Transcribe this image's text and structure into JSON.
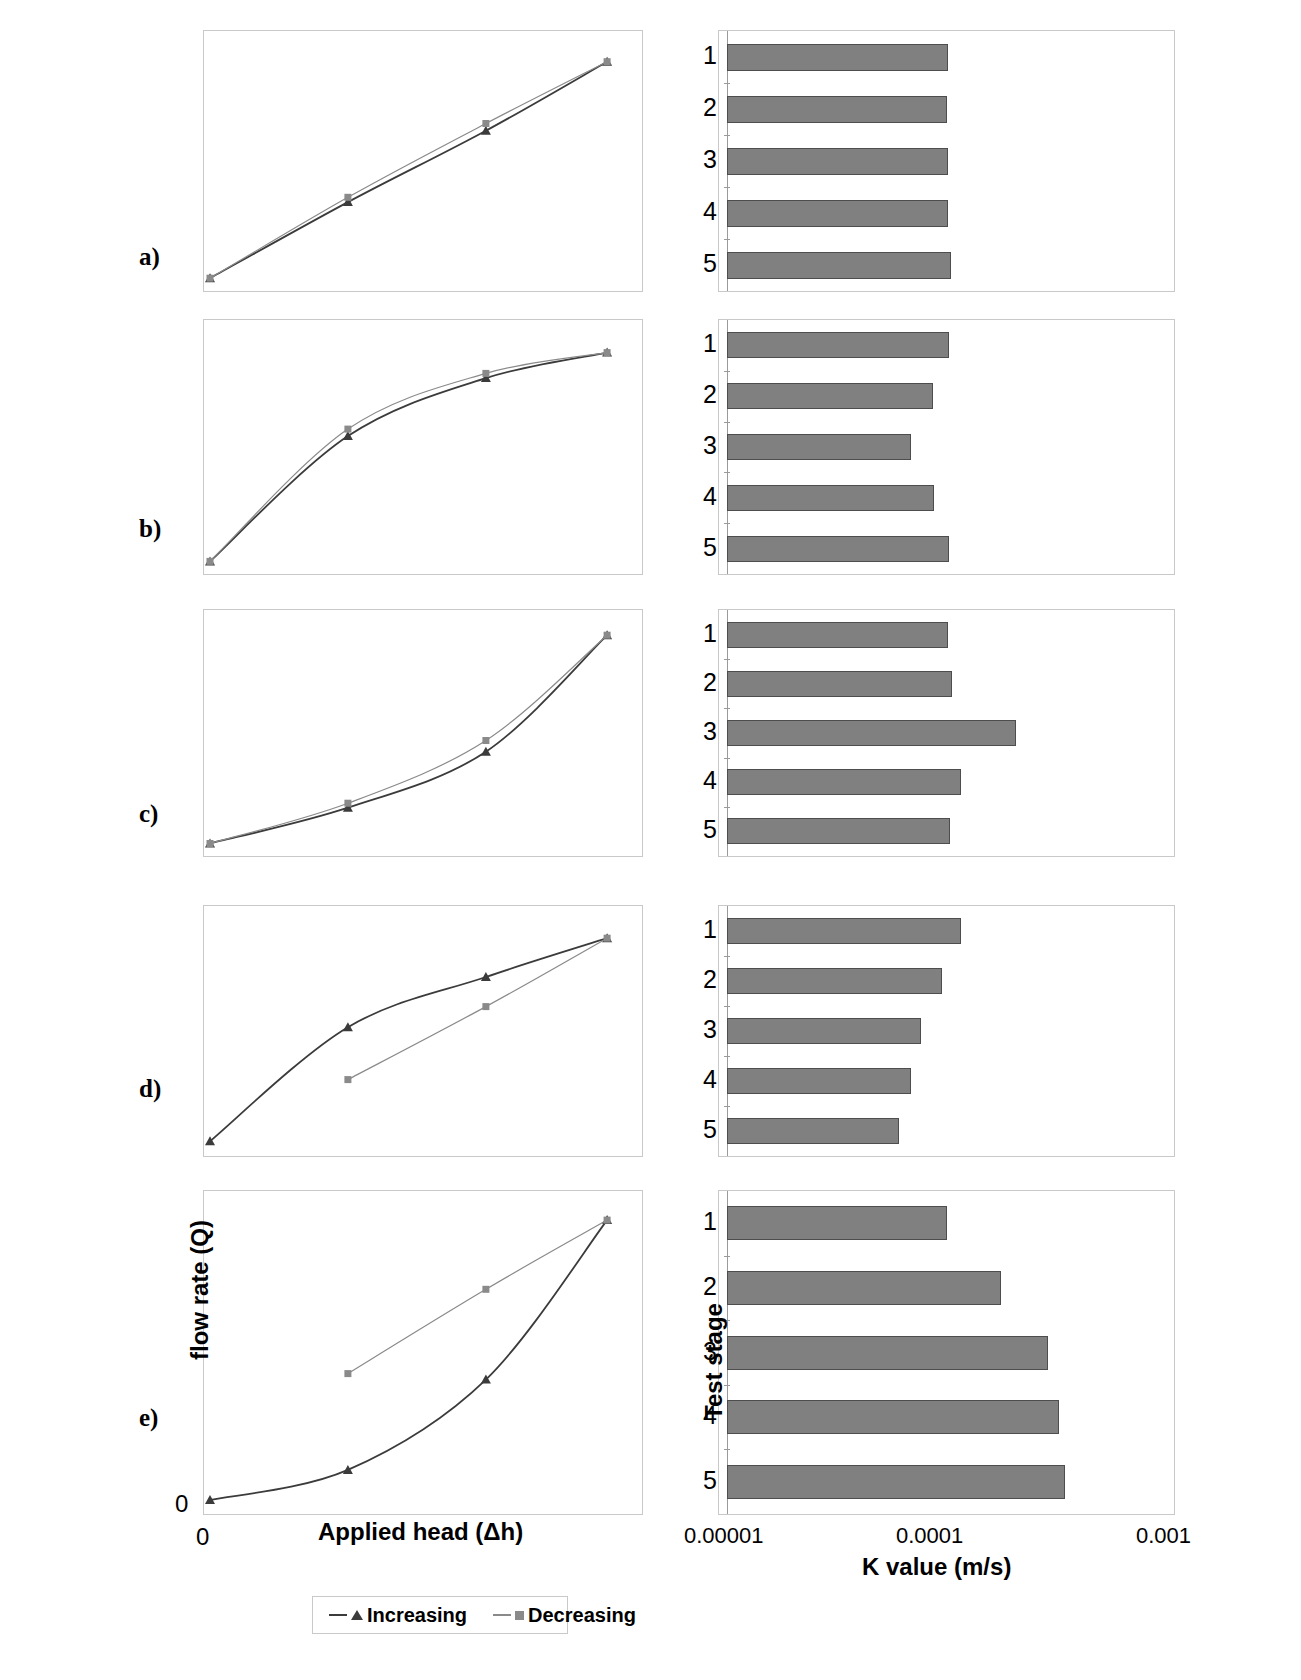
{
  "figure": {
    "panels": [
      "a)",
      "b)",
      "c)",
      "d)",
      "e)"
    ],
    "legend": {
      "increasing": "Increasing",
      "decreasing": "Decreasing"
    },
    "axes": {
      "left_ylabel": "flow rate (Q)",
      "left_xlabel": "Applied head (Δh)",
      "left_origin_y": "0",
      "left_origin_x": "0",
      "right_ylabel": "Test stage",
      "right_xlabel": "K value (m/s)",
      "right_xticks": [
        "0.00001",
        "0.0001",
        "0.001"
      ],
      "stage_labels": [
        "1",
        "2",
        "3",
        "4",
        "5"
      ]
    },
    "colors": {
      "bar_fill": "#808080",
      "bar_border": "#4d4d4d",
      "increasing_line": "#3b3b3b",
      "decreasing_line": "#8a8a8a",
      "frame": "#c9c9c9"
    }
  },
  "chart_data": [
    {
      "type": "line",
      "panel": "a)",
      "title": "Linear flow response — no hysteresis",
      "xlabel": "Applied head (Δh)",
      "ylabel": "flow rate (Q)",
      "xlim": [
        0,
        1
      ],
      "ylim": [
        0,
        1
      ],
      "series": [
        {
          "name": "Increasing",
          "x": [
            0.0,
            0.33,
            0.66,
            0.95
          ],
          "y": [
            0.02,
            0.34,
            0.64,
            0.93
          ]
        },
        {
          "name": "Decreasing",
          "x": [
            0.0,
            0.33,
            0.66,
            0.95
          ],
          "y": [
            0.02,
            0.36,
            0.67,
            0.93
          ]
        }
      ]
    },
    {
      "type": "bar",
      "panel": "a)",
      "title": "Hydraulic conductivity by test stage",
      "xlabel": "K value (m/s)",
      "ylabel": "Test stage",
      "xscale": "log",
      "xlim": [
        1e-05,
        0.001
      ],
      "categories": [
        "1",
        "2",
        "3",
        "4",
        "5"
      ],
      "values": [
        0.000101,
        9.9e-05,
        0.000101,
        0.000101,
        0.000104
      ]
    },
    {
      "type": "line",
      "panel": "b)",
      "title": "Concave flow response — decreasing slope",
      "xlabel": "Applied head (Δh)",
      "ylabel": "flow rate (Q)",
      "xlim": [
        0,
        1
      ],
      "ylim": [
        0,
        1
      ],
      "series": [
        {
          "name": "Increasing",
          "x": [
            0.0,
            0.33,
            0.66,
            0.95
          ],
          "y": [
            0.02,
            0.56,
            0.81,
            0.92
          ]
        },
        {
          "name": "Decreasing",
          "x": [
            0.0,
            0.33,
            0.66,
            0.95
          ],
          "y": [
            0.02,
            0.59,
            0.83,
            0.92
          ]
        }
      ]
    },
    {
      "type": "bar",
      "panel": "b)",
      "title": "Hydraulic conductivity by test stage",
      "xlabel": "K value (m/s)",
      "ylabel": "Test stage",
      "xscale": "log",
      "xlim": [
        1e-05,
        0.001
      ],
      "categories": [
        "1",
        "2",
        "3",
        "4",
        "5"
      ],
      "values": [
        0.000102,
        8.6e-05,
        6.8e-05,
        8.7e-05,
        0.000102
      ]
    },
    {
      "type": "line",
      "panel": "c)",
      "title": "Convex flow response — increasing slope",
      "xlabel": "Applied head (Δh)",
      "ylabel": "flow rate (Q)",
      "xlim": [
        0,
        1
      ],
      "ylim": [
        0,
        1
      ],
      "series": [
        {
          "name": "Increasing",
          "x": [
            0.0,
            0.33,
            0.66,
            0.95
          ],
          "y": [
            0.02,
            0.18,
            0.43,
            0.95
          ]
        },
        {
          "name": "Decreasing",
          "x": [
            0.0,
            0.33,
            0.66,
            0.95
          ],
          "y": [
            0.02,
            0.2,
            0.48,
            0.95
          ]
        }
      ]
    },
    {
      "type": "bar",
      "panel": "c)",
      "title": "Hydraulic conductivity by test stage",
      "xlabel": "K value (m/s)",
      "ylabel": "Test stage",
      "xscale": "log",
      "xlim": [
        1e-05,
        0.001
      ],
      "categories": [
        "1",
        "2",
        "3",
        "4",
        "5"
      ],
      "values": [
        0.000101,
        0.000105,
        0.000205,
        0.000115,
        0.000103
      ]
    },
    {
      "type": "line",
      "panel": "d)",
      "title": "Hysteresis loop — increasing above decreasing",
      "xlabel": "Applied head (Δh)",
      "ylabel": "flow rate (Q)",
      "xlim": [
        0,
        1
      ],
      "ylim": [
        0,
        1
      ],
      "series": [
        {
          "name": "Increasing",
          "x": [
            0.0,
            0.33,
            0.66,
            0.95
          ],
          "y": [
            0.03,
            0.53,
            0.75,
            0.92
          ]
        },
        {
          "name": "Decreasing",
          "x": [
            0.33,
            0.66,
            0.95
          ],
          "y": [
            0.3,
            0.62,
            0.92
          ]
        }
      ]
    },
    {
      "type": "bar",
      "panel": "d)",
      "title": "Hydraulic conductivity by test stage",
      "xlabel": "K value (m/s)",
      "ylabel": "Test stage",
      "xscale": "log",
      "xlim": [
        1e-05,
        0.001
      ],
      "categories": [
        "1",
        "2",
        "3",
        "4",
        "5"
      ],
      "values": [
        0.000115,
        9.4e-05,
        7.6e-05,
        6.8e-05,
        6e-05
      ]
    },
    {
      "type": "line",
      "panel": "e)",
      "title": "Wide hysteresis loop — decreasing above increasing",
      "xlabel": "Applied head (Δh)",
      "ylabel": "flow rate (Q)",
      "xlim": [
        0,
        1
      ],
      "ylim": [
        0,
        1
      ],
      "series": [
        {
          "name": "Increasing",
          "x": [
            0.0,
            0.33,
            0.66,
            0.95
          ],
          "y": [
            0.02,
            0.12,
            0.42,
            0.95
          ]
        },
        {
          "name": "Decreasing",
          "x": [
            0.33,
            0.66,
            0.95
          ],
          "y": [
            0.44,
            0.72,
            0.95
          ]
        }
      ]
    },
    {
      "type": "bar",
      "panel": "e)",
      "title": "Hydraulic conductivity by test stage",
      "xlabel": "K value (m/s)",
      "ylabel": "Test stage",
      "xscale": "log",
      "xlim": [
        1e-05,
        0.001
      ],
      "categories": [
        "1",
        "2",
        "3",
        "4",
        "5"
      ],
      "values": [
        9.9e-05,
        0.000175,
        0.000285,
        0.00032,
        0.00034
      ]
    }
  ]
}
